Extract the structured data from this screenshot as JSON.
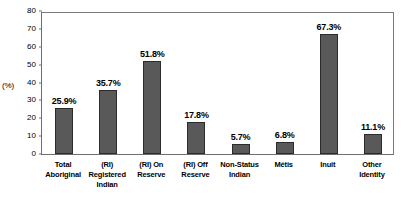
{
  "chart_data": {
    "type": "bar",
    "title": "",
    "subtitle": "",
    "xlabel": "",
    "ylabel": "(%)",
    "ylim": [
      0,
      80
    ],
    "yticks": [
      0,
      10,
      20,
      30,
      40,
      50,
      60,
      70,
      80
    ],
    "grid": false,
    "legend": null,
    "bar_color": "#595959",
    "bar_edge_color": "#2b2b2b",
    "axis_color": "#6e6e6e",
    "categories": [
      "Total\nAboriginal",
      "(RI)\nRegistered\nIndian",
      "(RI) On\nReserve",
      "(RI) Off\nReserve",
      "Non-Status\nIndian",
      "Métis",
      "Inuit",
      "Other\nIdentity"
    ],
    "values": [
      25.9,
      35.7,
      51.8,
      17.8,
      5.7,
      6.8,
      67.3,
      11.1
    ],
    "data_labels": [
      "25.9%",
      "35.7%",
      "51.8%",
      "17.8%",
      "5.7%",
      "6.8%",
      "67.3%",
      "11.1%"
    ],
    "ytick_labels": [
      "0",
      "10",
      "20",
      "30",
      "40",
      "50",
      "60",
      "70",
      "80"
    ]
  }
}
